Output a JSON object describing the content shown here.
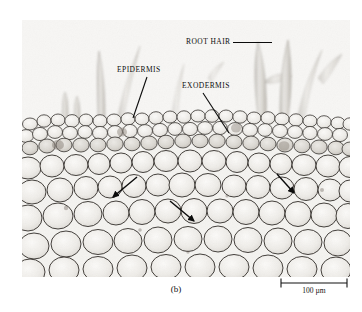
{
  "figure": {
    "caption": "(b)",
    "panel_background": "#f2f1ee"
  },
  "micrograph": {
    "description_name": "root-cross-section-micrograph",
    "tissue_tone_dark": "#4a4644",
    "tissue_tone_light": "#efedea",
    "cell_wall_color": "#3d3a37"
  },
  "annotations": {
    "root_hair": {
      "label": "ROOT HAIR",
      "leader": "horizontal"
    },
    "epidermis": {
      "label": "EPIDERMIS",
      "leader": "diagonal-down-left"
    },
    "exodermis": {
      "label": "EXODERMIS",
      "leader": "diagonal-down-right"
    },
    "arrows": [
      {
        "name": "cortex-arrow-left",
        "direction": "down-left"
      },
      {
        "name": "cortex-arrow-middle",
        "direction": "down-right"
      },
      {
        "name": "cortex-arrow-right",
        "direction": "down-right"
      }
    ]
  },
  "scale_bar": {
    "label": "100 µm",
    "length_px": 70
  }
}
